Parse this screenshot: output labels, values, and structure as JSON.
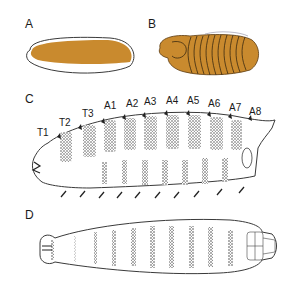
{
  "figure": {
    "panels": [
      {
        "id": "A",
        "label": "A",
        "description": "egg"
      },
      {
        "id": "B",
        "label": "B",
        "description": "segmented embryo"
      },
      {
        "id": "C",
        "label": "C",
        "description": "larva lateral view with denticle belts"
      },
      {
        "id": "D",
        "label": "D",
        "description": "larva ventral view"
      }
    ],
    "segment_labels": [
      "T1",
      "T2",
      "T3",
      "A1",
      "A2",
      "A3",
      "A4",
      "A5",
      "A6",
      "A7",
      "A8"
    ],
    "colors": {
      "embryo_fill": "#c98a2e",
      "outline": "#3a3a3a",
      "stipple": "#222222",
      "background": "#ffffff"
    }
  }
}
